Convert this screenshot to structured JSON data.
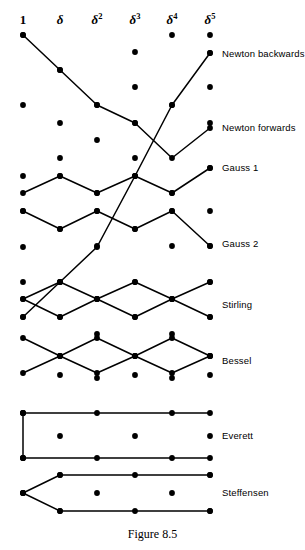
{
  "figure": {
    "caption": "Figure 8.5",
    "caption_y": 528,
    "width": 305,
    "height": 550,
    "ink_color": "#000000",
    "background_color": "#ffffff"
  },
  "grid": {
    "columns": [
      {
        "id": "c0",
        "x": 23,
        "header": "1",
        "superscript": "",
        "plain": true
      },
      {
        "id": "c1",
        "x": 60,
        "header": "δ",
        "superscript": "",
        "plain": false
      },
      {
        "id": "c2",
        "x": 97,
        "header": "δ",
        "superscript": "2",
        "plain": false
      },
      {
        "id": "c3",
        "x": 135,
        "header": "δ",
        "superscript": "3",
        "plain": false
      },
      {
        "id": "c4",
        "x": 172,
        "header": "δ",
        "superscript": "4",
        "plain": false
      },
      {
        "id": "c5",
        "x": 210,
        "header": "δ",
        "superscript": "5",
        "plain": false
      }
    ],
    "header_baseline_y": 26,
    "row_top_y": 35,
    "row_spacing": 17.6,
    "row_count": 29,
    "dot_radius": 2.9,
    "note": "checkerboard: even columns occupy even rows, odd columns occupy odd rows"
  },
  "schemes": [
    {
      "id": "newton-backwards",
      "label": "Newton backwards",
      "label_x": 222,
      "label_y": 54,
      "path": [
        [
          23,
          317
        ],
        [
          60,
          282
        ],
        [
          97,
          247
        ],
        [
          135,
          176
        ],
        [
          172,
          105
        ],
        [
          210,
          53
        ]
      ],
      "path_cells": "ascending diagonal from (1, row16) to (δ⁵, row1)"
    },
    {
      "id": "newton-forwards",
      "label": "Newton forwards",
      "label_x": 222,
      "label_y": 128,
      "path": [
        [
          23,
          35
        ],
        [
          60,
          70
        ],
        [
          97,
          105
        ],
        [
          135,
          123
        ],
        [
          172,
          158
        ],
        [
          210,
          128
        ]
      ],
      "path_cells": "descending diagonal from (1, row0) to (δ⁵, row5)"
    },
    {
      "id": "gauss-1",
      "label": "Gauss 1",
      "label_x": 222,
      "label_y": 168,
      "path": [
        [
          23,
          193
        ],
        [
          60,
          176
        ],
        [
          97,
          193
        ],
        [
          135,
          176
        ],
        [
          172,
          193
        ],
        [
          210,
          168
        ]
      ],
      "path_cells": "zig-zag forward Gauss"
    },
    {
      "id": "gauss-2",
      "label": "Gauss 2",
      "label_x": 222,
      "label_y": 244,
      "path": [
        [
          23,
          211
        ],
        [
          60,
          229
        ],
        [
          97,
          211
        ],
        [
          135,
          229
        ],
        [
          172,
          211
        ],
        [
          210,
          246
        ]
      ],
      "path_cells": "zig-zag backward Gauss"
    },
    {
      "id": "stirling",
      "label": "Stirling",
      "label_x": 222,
      "label_y": 305,
      "path_cells": "mean of two Gauss paths — lozenge / diamond chain",
      "paths": [
        [
          [
            23,
            299
          ],
          [
            60,
            282
          ],
          [
            97,
            299
          ],
          [
            135,
            282
          ],
          [
            172,
            299
          ],
          [
            210,
            282
          ]
        ],
        [
          [
            23,
            299
          ],
          [
            60,
            317
          ],
          [
            97,
            299
          ],
          [
            135,
            317
          ],
          [
            172,
            299
          ],
          [
            210,
            317
          ]
        ]
      ]
    },
    {
      "id": "bessel",
      "label": "Bessel",
      "label_x": 222,
      "label_y": 361,
      "path_cells": "offset lozenge chain, half-interval Bessel",
      "paths": [
        [
          [
            23,
            338
          ],
          [
            60,
            356
          ],
          [
            97,
            338
          ],
          [
            135,
            356
          ],
          [
            172,
            338
          ],
          [
            210,
            356
          ]
        ],
        [
          [
            23,
            373
          ],
          [
            60,
            356
          ],
          [
            97,
            373
          ],
          [
            135,
            356
          ],
          [
            172,
            373
          ],
          [
            210,
            356
          ]
        ]
      ]
    },
    {
      "id": "everett",
      "label": "Everett",
      "label_x": 222,
      "label_y": 436,
      "path_cells": "two horizontal runs joined by a vertical riser at column 1",
      "paths": [
        [
          [
            23,
            413
          ],
          [
            210,
            413
          ]
        ],
        [
          [
            23,
            458
          ],
          [
            210,
            458
          ]
        ],
        [
          [
            23,
            413
          ],
          [
            23,
            458
          ]
        ]
      ]
    },
    {
      "id": "steffensen",
      "label": "Steffensen",
      "label_x": 222,
      "label_y": 493,
      "path_cells": "fork from column 1 into two horizontal runs",
      "paths": [
        [
          [
            23,
            493
          ],
          [
            60,
            475
          ],
          [
            210,
            475
          ]
        ],
        [
          [
            23,
            493
          ],
          [
            60,
            511
          ],
          [
            210,
            511
          ]
        ]
      ]
    }
  ],
  "dots": {
    "c0": [
      35,
      105,
      176,
      211,
      247,
      282,
      317,
      413,
      458,
      493
    ],
    "c1": [
      70,
      123,
      158,
      176,
      229,
      282,
      317,
      356,
      375,
      436,
      475,
      511
    ],
    "c2": [
      105,
      140,
      193,
      211,
      246,
      299,
      334,
      378,
      413,
      458,
      493
    ],
    "c3": [
      52,
      87,
      123,
      158,
      176,
      229,
      282,
      317,
      356,
      375,
      436,
      475,
      511
    ],
    "c4": [
      35,
      105,
      193,
      211,
      246,
      299,
      334,
      378,
      413,
      458,
      493
    ],
    "c5": [
      35,
      53,
      87,
      123,
      168,
      211,
      246,
      282,
      317,
      356,
      375,
      436,
      475,
      511
    ]
  }
}
